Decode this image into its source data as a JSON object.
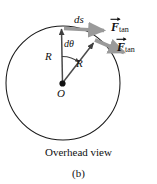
{
  "figure": {
    "domain": "physics-diagram",
    "title_caption": "Overhead view",
    "panel_label": "(b)",
    "colors": {
      "outline": "#1a1a1a",
      "force_arrow": "#9a9a9a",
      "radius_arrow": "#4a4a4a",
      "center_dot": "#111111",
      "background": "#ffffff"
    },
    "labels": {
      "arc_length": "ds",
      "angle": "dθ",
      "radius_vertical": "R",
      "radius_slant": "R",
      "center": "O"
    },
    "vectors": [
      {
        "name": "F-tan-upper",
        "symbol": "F",
        "subscript": "tan",
        "accent": "arrow",
        "color": "#9a9a9a"
      },
      {
        "name": "F-tan-lower",
        "symbol": "F",
        "subscript": "tan",
        "accent": "arrow",
        "color": "#9a9a9a"
      }
    ],
    "geometry": {
      "circle_center_x": 63,
      "circle_center_y": 83,
      "circle_radius": 57
    }
  }
}
